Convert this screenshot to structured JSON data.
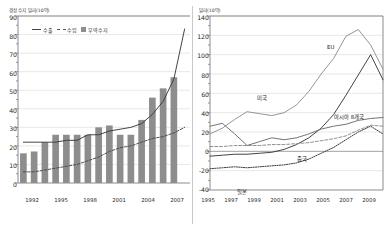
{
  "chart_data": [
    {
      "id": "left",
      "type": "bar",
      "title": "",
      "ylabel": "경상 수지 달러(10억)",
      "xlabel": "",
      "ylim": [
        0,
        90
      ],
      "yticks": [
        0,
        10,
        20,
        30,
        40,
        50,
        60,
        70,
        80,
        90
      ],
      "xlim": [
        1992,
        2008
      ],
      "xticks": [
        1992,
        1995,
        1998,
        2001,
        2004,
        2007
      ],
      "grid": true,
      "legend_position": "top-left",
      "categories": [
        1992,
        1993,
        1994,
        1995,
        1996,
        1997,
        1998,
        1999,
        2000,
        2001,
        2002,
        2003,
        2004,
        2005,
        2006,
        2007
      ],
      "series": [
        {
          "name": "무역수지",
          "type": "bar",
          "color": "#8d8d8d",
          "values": [
            16,
            17,
            22,
            26,
            26,
            26,
            26,
            30,
            31,
            26,
            26,
            34,
            46,
            51,
            57,
            0
          ]
        },
        {
          "name": "수출",
          "type": "line",
          "style": "solid",
          "color": "#3a3a3a",
          "values": [
            22,
            22,
            22,
            22,
            23,
            23,
            26,
            26,
            28,
            29,
            30,
            32,
            37,
            44,
            56,
            83
          ]
        },
        {
          "name": "수입",
          "type": "line",
          "style": "dashed",
          "color": "#4a4a4a",
          "values": [
            6,
            6,
            7,
            8,
            9,
            10,
            12,
            14,
            17,
            19,
            20,
            22,
            24,
            25,
            27,
            30
          ]
        }
      ]
    },
    {
      "id": "right",
      "type": "line",
      "title": "",
      "ylabel": "달러(10억)",
      "xlabel": "",
      "ylim": [
        -40,
        140
      ],
      "yticks": [
        -40,
        -20,
        0,
        20,
        40,
        60,
        80,
        100,
        120,
        140
      ],
      "xlim": [
        1995,
        2009
      ],
      "xticks": [
        1995,
        1997,
        1999,
        2001,
        2003,
        2005,
        2007,
        2009
      ],
      "grid": true,
      "legend_position": "inline-labels",
      "x": [
        1995,
        1996,
        1997,
        1998,
        1999,
        2000,
        2001,
        2002,
        2003,
        2004,
        2005,
        2006,
        2007,
        2008,
        2009
      ],
      "series": [
        {
          "name": "EU",
          "style": "solid",
          "color": "#909090",
          "values": [
            18,
            24,
            33,
            41,
            39,
            37,
            40,
            48,
            62,
            80,
            96,
            119,
            126,
            110,
            85
          ]
        },
        {
          "name": "미국",
          "style": "solid",
          "color": "#3a3a3a",
          "values": [
            -5,
            -4,
            -3,
            -3,
            -2,
            -1,
            2,
            7,
            14,
            24,
            38,
            58,
            79,
            100,
            74
          ]
        },
        {
          "name": "아시아 8개국",
          "style": "solid",
          "color": "#6d6d6d",
          "values": [
            26,
            29,
            18,
            6,
            10,
            14,
            12,
            14,
            18,
            23,
            26,
            28,
            32,
            34,
            35
          ]
        },
        {
          "name": "중국",
          "style": "dashed",
          "color": "#8a8a8a",
          "values": [
            5,
            5,
            6,
            6,
            6,
            7,
            7,
            8,
            9,
            11,
            13,
            16,
            22,
            27,
            26
          ]
        },
        {
          "name": "일본",
          "style": "dotted",
          "color": "#2f2f2f",
          "values": [
            -18,
            -17,
            -16,
            -17,
            -16,
            -15,
            -14,
            -12,
            -8,
            -2,
            4,
            12,
            20,
            26,
            18
          ]
        }
      ]
    }
  ],
  "left": {
    "unit_label": "경상 수지 달러(10억)",
    "yticks": [
      "90",
      "80",
      "70",
      "60",
      "50",
      "40",
      "30",
      "20",
      "10",
      "0"
    ],
    "xticks": [
      "1992",
      "1995",
      "1998",
      "2001",
      "2004",
      "2007"
    ],
    "legend": [
      {
        "key": "export",
        "label": "수출",
        "marker": "solid-line"
      },
      {
        "key": "import",
        "label": "수입",
        "marker": "dashed-line"
      },
      {
        "key": "balance",
        "label": "무역수지",
        "marker": "filled-square"
      }
    ]
  },
  "right": {
    "unit_label": "달러(10억)",
    "yticks": [
      "140",
      "120",
      "100",
      "80",
      "60",
      "40",
      "20",
      "0",
      "-20",
      "-40"
    ],
    "xticks": [
      "1995",
      "1997",
      "1999",
      "2001",
      "2003",
      "2005",
      "2007",
      "2009"
    ],
    "labels": [
      {
        "key": "eu",
        "label": "EU"
      },
      {
        "key": "usa",
        "label": "미국"
      },
      {
        "key": "asia8",
        "label": "아시아 8개국"
      },
      {
        "key": "china",
        "label": "중국"
      },
      {
        "key": "japan",
        "label": "일본"
      }
    ]
  }
}
